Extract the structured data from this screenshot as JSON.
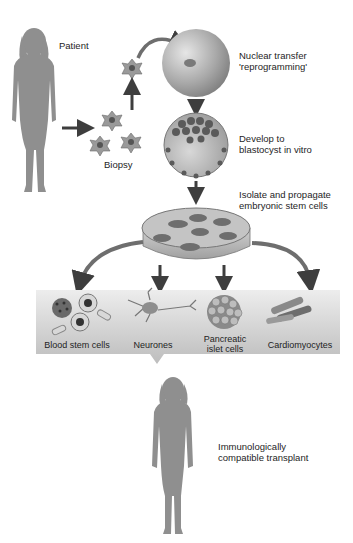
{
  "diagram": {
    "colors": {
      "silhouette": "#8f8f8f",
      "arrow": "#4a4a4a",
      "banner": "#c9c9c9",
      "egg": "#a5a5a5"
    },
    "nodes": {
      "patient": {
        "label": "Patient"
      },
      "biopsy": {
        "label": "Biopsy"
      },
      "nuclear_transfer": {
        "line1": "Nuclear transfer",
        "line2": "'reprogramming'"
      },
      "blastocyst": {
        "line1": "Develop to",
        "line2": "blastocyst in vitro"
      },
      "stem_cells": {
        "line1": "Isolate and propagate",
        "line2": "embryonic stem cells"
      },
      "transplant": {
        "line1": "Immunologically",
        "line2": "compatible transplant"
      }
    },
    "cell_types": [
      {
        "label": "Blood stem cells"
      },
      {
        "label": "Neurones"
      },
      {
        "line1": "Pancreatic",
        "line2": "islet cells"
      },
      {
        "label": "Cardiomyocytes"
      }
    ]
  }
}
